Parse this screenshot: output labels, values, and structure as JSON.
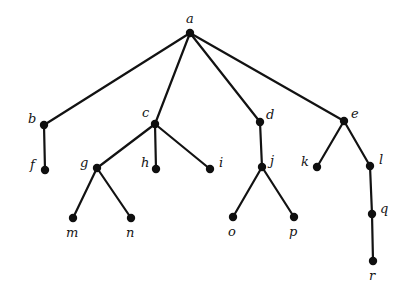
{
  "figure": {
    "kind": "rooted-tree-diagram",
    "background_color": "#ffffff",
    "node_color": "#0f0f0f",
    "edge_color": "#121212",
    "label_color": "#141414",
    "node_radius": 4.2,
    "edge_width": 2.2,
    "width": 411,
    "height": 301
  },
  "nodes": [
    {
      "id": "a",
      "label": "a",
      "x": 190,
      "y": 33,
      "label_x": 186,
      "label_y": 12,
      "label_anchor": "above"
    },
    {
      "id": "b",
      "label": "b",
      "x": 44,
      "y": 125,
      "label_x": 28,
      "label_y": 112,
      "label_anchor": "left"
    },
    {
      "id": "c",
      "label": "c",
      "x": 155,
      "y": 124,
      "label_x": 142,
      "label_y": 106,
      "label_anchor": "above-left"
    },
    {
      "id": "d",
      "label": "d",
      "x": 260,
      "y": 122,
      "label_x": 266,
      "label_y": 108,
      "label_anchor": "right"
    },
    {
      "id": "e",
      "label": "e",
      "x": 344,
      "y": 121,
      "label_x": 351,
      "label_y": 107,
      "label_anchor": "right"
    },
    {
      "id": "f",
      "label": "f",
      "x": 45,
      "y": 170,
      "label_x": 30,
      "label_y": 158,
      "label_anchor": "left"
    },
    {
      "id": "g",
      "label": "g",
      "x": 97,
      "y": 168,
      "label_x": 80,
      "label_y": 156,
      "label_anchor": "left"
    },
    {
      "id": "h",
      "label": "h",
      "x": 156,
      "y": 169,
      "label_x": 141,
      "label_y": 156,
      "label_anchor": "left"
    },
    {
      "id": "i",
      "label": "i",
      "x": 210,
      "y": 169,
      "label_x": 219,
      "label_y": 156,
      "label_anchor": "right"
    },
    {
      "id": "j",
      "label": "j",
      "x": 262,
      "y": 167,
      "label_x": 270,
      "label_y": 154,
      "label_anchor": "right"
    },
    {
      "id": "k",
      "label": "k",
      "x": 317,
      "y": 167,
      "label_x": 301,
      "label_y": 155,
      "label_anchor": "left"
    },
    {
      "id": "l",
      "label": "l",
      "x": 370,
      "y": 166,
      "label_x": 379,
      "label_y": 153,
      "label_anchor": "right"
    },
    {
      "id": "m",
      "label": "m",
      "x": 73,
      "y": 218,
      "label_x": 66,
      "label_y": 226,
      "label_anchor": "below"
    },
    {
      "id": "n",
      "label": "n",
      "x": 131,
      "y": 218,
      "label_x": 126,
      "label_y": 226,
      "label_anchor": "below"
    },
    {
      "id": "o",
      "label": "o",
      "x": 233,
      "y": 217,
      "label_x": 228,
      "label_y": 225,
      "label_anchor": "below"
    },
    {
      "id": "p",
      "label": "p",
      "x": 294,
      "y": 217,
      "label_x": 289,
      "label_y": 225,
      "label_anchor": "below"
    },
    {
      "id": "q",
      "label": "q",
      "x": 372,
      "y": 214,
      "label_x": 380,
      "label_y": 202,
      "label_anchor": "right"
    },
    {
      "id": "r",
      "label": "r",
      "x": 373,
      "y": 261,
      "label_x": 369,
      "label_y": 269,
      "label_anchor": "below"
    }
  ],
  "edges": [
    {
      "from": "a",
      "to": "b"
    },
    {
      "from": "a",
      "to": "c"
    },
    {
      "from": "a",
      "to": "d"
    },
    {
      "from": "a",
      "to": "e"
    },
    {
      "from": "b",
      "to": "f"
    },
    {
      "from": "c",
      "to": "g"
    },
    {
      "from": "c",
      "to": "h"
    },
    {
      "from": "c",
      "to": "i"
    },
    {
      "from": "d",
      "to": "j"
    },
    {
      "from": "e",
      "to": "k"
    },
    {
      "from": "e",
      "to": "l"
    },
    {
      "from": "g",
      "to": "m"
    },
    {
      "from": "g",
      "to": "n"
    },
    {
      "from": "j",
      "to": "o"
    },
    {
      "from": "j",
      "to": "p"
    },
    {
      "from": "l",
      "to": "q"
    },
    {
      "from": "q",
      "to": "r"
    }
  ]
}
